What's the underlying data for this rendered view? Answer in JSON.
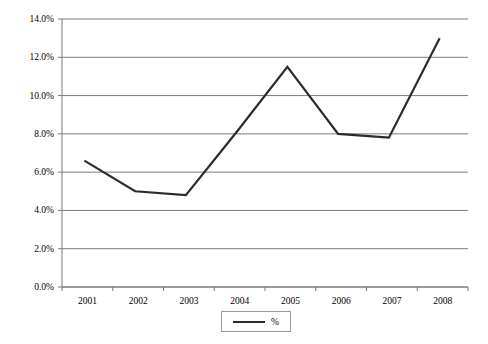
{
  "chart_data": {
    "type": "line",
    "title": "",
    "xlabel": "",
    "ylabel": "",
    "categories": [
      "2001",
      "2002",
      "2003",
      "2004",
      "2005",
      "2006",
      "2007",
      "2008"
    ],
    "series": [
      {
        "name": "%",
        "values": [
          6.6,
          5.0,
          4.8,
          8.1,
          11.5,
          8.0,
          7.8,
          13.0
        ],
        "color": "#2b2b2b"
      }
    ],
    "ylim": [
      0.0,
      14.0
    ],
    "ytick_values": [
      0.0,
      2.0,
      4.0,
      6.0,
      8.0,
      10.0,
      12.0,
      14.0
    ],
    "ytick_labels": [
      "0.0%",
      "2.0%",
      "4.0%",
      "6.0%",
      "8.0%",
      "10.0%",
      "12.0%",
      "14.0%"
    ],
    "xtick_labels": [
      "2001",
      "2002",
      "2003",
      "2004",
      "2005",
      "2006",
      "2007",
      "2008"
    ],
    "grid": "horizontal",
    "legend_position": "bottom-center",
    "legend_entries": [
      "%"
    ],
    "axis_color": "#7a7a7a",
    "grid_color": "#7a7a7a",
    "plot_background": "#ffffff"
  },
  "legend": {
    "label": "%"
  }
}
